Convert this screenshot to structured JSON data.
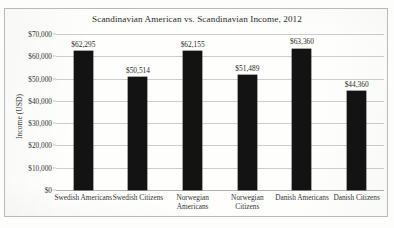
{
  "chart_data": {
    "type": "bar",
    "title": "Scandinavian American vs. Scandinavian Income, 2012",
    "xlabel": "",
    "ylabel": "Income (USD)",
    "categories": [
      "Swedish Americans",
      "Swedish Citizens",
      "Norwegian Americans",
      "Norwegian Citizens",
      "Danish Americans",
      "Danish Citizens"
    ],
    "values": [
      62295,
      50514,
      62155,
      51489,
      63360,
      44360
    ],
    "value_labels": [
      "$62,295",
      "$50,514",
      "$62,155",
      "$51,489",
      "$63,360",
      "$44,360"
    ],
    "ylim": [
      0,
      70000
    ],
    "ytick_values": [
      0,
      10000,
      20000,
      30000,
      40000,
      50000,
      60000,
      70000
    ],
    "ytick_labels": [
      "$0",
      "$10,000",
      "$20,000",
      "$30,000",
      "$40,000",
      "$50,000",
      "$60,000",
      "$70,000"
    ],
    "grid": "horizontal",
    "legend": "none",
    "bar_color": "#131313",
    "gridline_color": "#cdcdcd"
  }
}
